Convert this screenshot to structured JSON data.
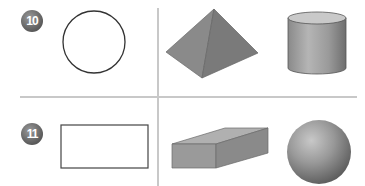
{
  "problems": [
    {
      "number": "10",
      "shapes": [
        "circle",
        "square pyramid",
        "cylinder"
      ]
    },
    {
      "number": "11",
      "shapes": [
        "rectangle",
        "rectangular prism",
        "sphere"
      ]
    }
  ]
}
